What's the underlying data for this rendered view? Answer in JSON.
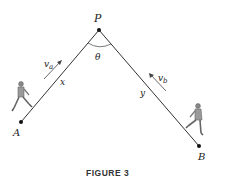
{
  "figure": {
    "caption": "FIGURE 3",
    "points": {
      "P": {
        "label": "P",
        "x": 99,
        "y": 30
      },
      "A": {
        "label": "A",
        "x": 21,
        "y": 122
      },
      "B": {
        "label": "B",
        "x": 199,
        "y": 146
      }
    },
    "angle_label": "θ",
    "segments": {
      "PA": {
        "label": "x"
      },
      "PB": {
        "label": "y"
      }
    },
    "velocities": {
      "a": {
        "label": "v",
        "subscript": "a"
      },
      "b": {
        "label": "v",
        "subscript": "b"
      }
    },
    "figures": [
      "walker-near-A",
      "walker-near-B"
    ],
    "colors": {
      "line": "#333333",
      "text": "#222222",
      "person": "#777777"
    }
  }
}
